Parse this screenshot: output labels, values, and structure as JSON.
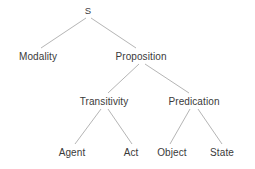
{
  "diagram": {
    "type": "tree",
    "background_color": "#ffffff",
    "edge_color": "#b5b5b5",
    "text_color": "#3a3a3a",
    "nodes": [
      {
        "id": "s",
        "label": "S",
        "x": 88,
        "y": 11,
        "level": 0
      },
      {
        "id": "modality",
        "label": "Modality",
        "x": 38,
        "y": 57,
        "level": 1
      },
      {
        "id": "proposition",
        "label": "Proposition",
        "x": 141,
        "y": 57,
        "level": 1
      },
      {
        "id": "transitivity",
        "label": "Transitivity",
        "x": 104,
        "y": 102,
        "level": 2
      },
      {
        "id": "predication",
        "label": "Predication",
        "x": 194,
        "y": 102,
        "level": 2
      },
      {
        "id": "agent",
        "label": "Agent",
        "x": 72,
        "y": 153,
        "level": 3
      },
      {
        "id": "act",
        "label": "Act",
        "x": 131,
        "y": 153,
        "level": 3
      },
      {
        "id": "object",
        "label": "Object",
        "x": 172,
        "y": 153,
        "level": 3
      },
      {
        "id": "state",
        "label": "State",
        "x": 222,
        "y": 153,
        "level": 3
      }
    ],
    "edges": [
      {
        "id": "s-modality",
        "from": "s",
        "to": "modality",
        "x1": 86,
        "y1": 18,
        "x2": 41,
        "y2": 48
      },
      {
        "id": "s-proposition",
        "from": "s",
        "to": "proposition",
        "x1": 91,
        "y1": 18,
        "x2": 136,
        "y2": 48
      },
      {
        "id": "proposition-transitivity",
        "from": "proposition",
        "to": "transitivity",
        "x1": 139,
        "y1": 64,
        "x2": 108,
        "y2": 93
      },
      {
        "id": "proposition-predication",
        "from": "proposition",
        "to": "predication",
        "x1": 145,
        "y1": 64,
        "x2": 189,
        "y2": 93
      },
      {
        "id": "transitivity-agent",
        "from": "transitivity",
        "to": "agent",
        "x1": 101,
        "y1": 109,
        "x2": 75,
        "y2": 144
      },
      {
        "id": "transitivity-act",
        "from": "transitivity",
        "to": "act",
        "x1": 108,
        "y1": 109,
        "x2": 132,
        "y2": 144
      },
      {
        "id": "predication-object",
        "from": "predication",
        "to": "object",
        "x1": 190,
        "y1": 109,
        "x2": 170,
        "y2": 144
      },
      {
        "id": "predication-state",
        "from": "predication",
        "to": "state",
        "x1": 198,
        "y1": 109,
        "x2": 222,
        "y2": 144
      }
    ]
  }
}
